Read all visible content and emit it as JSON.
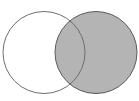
{
  "diagram": {
    "type": "venn",
    "sets": [
      {
        "name": "left-set",
        "shaded": false
      },
      {
        "name": "right-set",
        "shaded": true
      }
    ],
    "shaded_region": "right circle (including intersection)",
    "colors": {
      "background": "#ffffff",
      "outline": "#6e6e6e",
      "shade": "#b4b4b4",
      "unshaded_fill": "#ffffff"
    }
  }
}
